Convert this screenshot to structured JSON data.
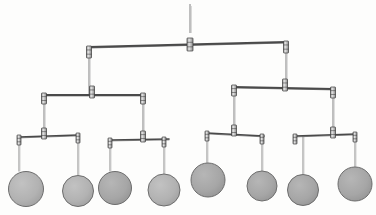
{
  "figure": {
    "kind": "kinetic-mobile-binary-tree",
    "width": 376,
    "height": 215,
    "background_color": "#fdfdfc",
    "rod_color": "#4a4a4a",
    "wire_color": "#8a8a8a",
    "connector_fill": "#d8d8d8",
    "connector_stroke": "#3a3a3a",
    "disc_fill": "#a8a8a8",
    "disc_fill_light": "#b4b4b4",
    "disc_stroke": "#6d6d6d",
    "levels": 4,
    "disc_count": 8
  },
  "suspension": {
    "name": "top-suspension-wire",
    "x": 190,
    "y_top": 4,
    "y_bottom": 33
  },
  "rods": [
    {
      "id": "rod-L1",
      "level": 1,
      "x1": 89,
      "y1": 47,
      "x2": 286,
      "y2": 42,
      "pivot_x": 190,
      "pivot_y": 44.4,
      "thickness": 2.0
    },
    {
      "id": "rod-L2-left",
      "level": 2,
      "x1": 44,
      "y1": 95,
      "x2": 143,
      "y2": 95,
      "pivot_x": 92,
      "pivot_y": 95,
      "thickness": 1.8
    },
    {
      "id": "rod-L2-right",
      "level": 2,
      "x1": 234,
      "y1": 87,
      "x2": 333,
      "y2": 89,
      "pivot_x": 285,
      "pivot_y": 88,
      "thickness": 1.8
    },
    {
      "id": "rod-L3-a",
      "level": 3,
      "x1": 19,
      "y1": 137,
      "x2": 78,
      "y2": 135,
      "pivot_x": 44,
      "pivot_y": 136,
      "thickness": 1.6
    },
    {
      "id": "rod-L3-b",
      "level": 3,
      "x1": 110,
      "y1": 140,
      "x2": 169,
      "y2": 139,
      "pivot_x": 143,
      "pivot_y": 139,
      "thickness": 1.6
    },
    {
      "id": "rod-L3-c",
      "level": 3,
      "x1": 207,
      "y1": 133,
      "x2": 264,
      "y2": 136,
      "pivot_x": 234,
      "pivot_y": 134,
      "thickness": 1.6
    },
    {
      "id": "rod-L3-d",
      "level": 3,
      "x1": 295,
      "y1": 136,
      "x2": 356,
      "y2": 134,
      "pivot_x": 333,
      "pivot_y": 134.6,
      "thickness": 1.6
    }
  ],
  "hangers": [
    {
      "id": "hang-L1-left",
      "x": 89,
      "y1": 47,
      "y2": 95
    },
    {
      "id": "hang-L1-right",
      "x": 286,
      "y1": 42,
      "y2": 87
    },
    {
      "id": "hang-L2a",
      "x": 44,
      "y1": 95,
      "y2": 137
    },
    {
      "id": "hang-L2b",
      "x": 143,
      "y1": 95,
      "y2": 140
    },
    {
      "id": "hang-L2c",
      "x": 234,
      "y1": 87,
      "y2": 133
    },
    {
      "id": "hang-L2d",
      "x": 333,
      "y1": 89,
      "y2": 136
    }
  ],
  "discs": [
    {
      "id": "disc-1",
      "cx": 26,
      "cy": 189,
      "r": 17.5,
      "wire_x": 19,
      "wire_y1": 137,
      "wire_y2": 171.5,
      "shade": "light"
    },
    {
      "id": "disc-2",
      "cx": 78,
      "cy": 191,
      "r": 15.5,
      "wire_x": 78,
      "wire_y1": 135,
      "wire_y2": 175.5,
      "shade": "light"
    },
    {
      "id": "disc-3",
      "cx": 115,
      "cy": 188,
      "r": 16.5,
      "wire_x": 110,
      "wire_y1": 140,
      "wire_y2": 171.5,
      "shade": "mid"
    },
    {
      "id": "disc-4",
      "cx": 164,
      "cy": 190,
      "r": 16.0,
      "wire_x": 164,
      "wire_y1": 139,
      "wire_y2": 174.0,
      "shade": "light"
    },
    {
      "id": "disc-5",
      "cx": 208,
      "cy": 180,
      "r": 17.0,
      "wire_x": 207,
      "wire_y1": 133,
      "wire_y2": 163.0,
      "shade": "mid"
    },
    {
      "id": "disc-6",
      "cx": 262,
      "cy": 186,
      "r": 15.0,
      "wire_x": 262,
      "wire_y1": 136,
      "wire_y2": 171.0,
      "shade": "mid"
    },
    {
      "id": "disc-7",
      "cx": 303,
      "cy": 190,
      "r": 15.5,
      "wire_x": 303,
      "wire_y1": 136,
      "wire_y2": 174.5,
      "shade": "mid"
    },
    {
      "id": "disc-8",
      "cx": 355,
      "cy": 184,
      "r": 17.0,
      "wire_x": 355,
      "wire_y1": 134,
      "wire_y2": 167.0,
      "shade": "mid"
    }
  ],
  "connectors": [
    {
      "id": "conn-top-pivot",
      "x": 190,
      "y": 38,
      "w": 6,
      "h": 13
    },
    {
      "id": "conn-L1-left",
      "x": 89,
      "y": 46,
      "w": 5,
      "h": 12
    },
    {
      "id": "conn-L1-right",
      "x": 286,
      "y": 41,
      "w": 5,
      "h": 12
    },
    {
      "id": "conn-L2L-pivot",
      "x": 92,
      "y": 86,
      "w": 5,
      "h": 12
    },
    {
      "id": "conn-L2R-pivot",
      "x": 285,
      "y": 79,
      "w": 5,
      "h": 12
    },
    {
      "id": "conn-L2L-left",
      "x": 44,
      "y": 93,
      "w": 5,
      "h": 11
    },
    {
      "id": "conn-L2L-right",
      "x": 143,
      "y": 93,
      "w": 5,
      "h": 11
    },
    {
      "id": "conn-L2R-left",
      "x": 234,
      "y": 85,
      "w": 5,
      "h": 11
    },
    {
      "id": "conn-L2R-right",
      "x": 333,
      "y": 87,
      "w": 5,
      "h": 11
    },
    {
      "id": "conn-L3a-pivot",
      "x": 44,
      "y": 128,
      "w": 5,
      "h": 11
    },
    {
      "id": "conn-L3b-pivot",
      "x": 143,
      "y": 131,
      "w": 5,
      "h": 11
    },
    {
      "id": "conn-L3c-pivot",
      "x": 234,
      "y": 125,
      "w": 5,
      "h": 11
    },
    {
      "id": "conn-L3d-pivot",
      "x": 333,
      "y": 127,
      "w": 5,
      "h": 11
    },
    {
      "id": "conn-L3a-left",
      "x": 19,
      "y": 135,
      "w": 4,
      "h": 10
    },
    {
      "id": "conn-L3a-right",
      "x": 78,
      "y": 133,
      "w": 4,
      "h": 10
    },
    {
      "id": "conn-L3b-left",
      "x": 110,
      "y": 138,
      "w": 4,
      "h": 10
    },
    {
      "id": "conn-L3b-right",
      "x": 164,
      "y": 137,
      "w": 4,
      "h": 10
    },
    {
      "id": "conn-L3c-left",
      "x": 207,
      "y": 131,
      "w": 4,
      "h": 10
    },
    {
      "id": "conn-L3c-right",
      "x": 262,
      "y": 134,
      "w": 4,
      "h": 10
    },
    {
      "id": "conn-L3d-left",
      "x": 295,
      "y": 134,
      "w": 4,
      "h": 10
    },
    {
      "id": "conn-L3d-right",
      "x": 355,
      "y": 132,
      "w": 4,
      "h": 10
    }
  ]
}
